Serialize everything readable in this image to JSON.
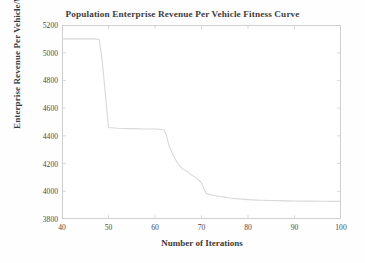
{
  "chart_data": {
    "type": "line",
    "title": "Population Enterprise Revenue Per Vehicle Fitness Curve",
    "xlabel": "Number of Iterations",
    "ylabel": "Enterprise Revenue Per Vehicle/¥",
    "xlim": [
      40,
      100
    ],
    "ylim": [
      3800,
      5200
    ],
    "xticks": [
      40,
      50,
      60,
      70,
      80,
      90,
      100
    ],
    "yticks": [
      3800,
      4000,
      4200,
      4400,
      4600,
      4800,
      5000,
      5200
    ],
    "xtick_labels": [
      "40",
      "50",
      "60",
      "70",
      "80",
      "90",
      "100"
    ],
    "ytick_labels": [
      "3800",
      "4000",
      "4200",
      "4400",
      "4600",
      "4800",
      "5000",
      "5200"
    ],
    "grid": false,
    "legend": null,
    "legend_position": "none",
    "line_color": "#d8d8d8",
    "frame_color": "#cfcfcf",
    "background": "#ffffff",
    "series": [
      {
        "name": "Enterprise Revenue Per Vehicle",
        "x": [
          40,
          42,
          44,
          46,
          47,
          48,
          48.5,
          49,
          49.5,
          50,
          52,
          55,
          58,
          60,
          61,
          62,
          62.5,
          63,
          64,
          65,
          66,
          67,
          68,
          69,
          70,
          70.5,
          71,
          72,
          73,
          74,
          75,
          76,
          78,
          80,
          82,
          85,
          88,
          90,
          93,
          96,
          100
        ],
        "values": [
          5100,
          5100,
          5100,
          5100,
          5100,
          5095,
          4980,
          4820,
          4640,
          4460,
          4455,
          4452,
          4450,
          4450,
          4448,
          4440,
          4400,
          4330,
          4255,
          4195,
          4160,
          4140,
          4115,
          4095,
          4060,
          4020,
          3985,
          3975,
          3968,
          3962,
          3958,
          3952,
          3945,
          3940,
          3936,
          3933,
          3931,
          3930,
          3929,
          3928,
          3927
        ]
      }
    ]
  }
}
